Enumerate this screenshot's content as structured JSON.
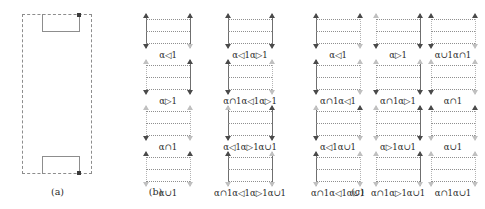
{
  "figure": {
    "width": 485,
    "height": 209,
    "background": "#ffffff",
    "ink": "#2a2a2a",
    "rail_solid_color": "#6f6f6f",
    "rail_dotted_color": "#b4b4b4",
    "hbar_color": "#8f8f8f",
    "marker_color": "#3a3a3a"
  },
  "panels": [
    {
      "id": "a",
      "caption": "(a)",
      "kind": "region-sketch",
      "description": "dashed rectangular region with solid notch at top and bottom",
      "markers": 2
    },
    {
      "id": "b",
      "caption": "(b)",
      "kind": "cell-grid",
      "columns": 1,
      "rows": 4,
      "cells": [
        {
          "label": "α◁1",
          "base": "α",
          "operators": [
            "◁"
          ],
          "index": "1",
          "left_rail": "solid",
          "right_rail": "solid",
          "left_arrow_top": true,
          "left_arrow_bottom": true,
          "right_arrow_top": true,
          "right_arrow_bottom": false
        },
        {
          "label": "α▷1",
          "base": "α",
          "operators": [
            "▷"
          ],
          "index": "1",
          "left_rail": "dotted",
          "right_rail": "solid",
          "left_arrow_top": false,
          "left_arrow_bottom": true,
          "right_arrow_top": true,
          "right_arrow_bottom": true
        },
        {
          "label": "α∩1",
          "base": "α",
          "operators": [
            "∩"
          ],
          "index": "1",
          "left_rail": "dotted",
          "right_rail": "dotted",
          "left_arrow_top": false,
          "left_arrow_bottom": true,
          "right_arrow_top": false,
          "right_arrow_bottom": false
        },
        {
          "label": "α∪1",
          "base": "α",
          "operators": [
            "∪"
          ],
          "index": "1",
          "left_rail": "dotted",
          "right_rail": "dotted",
          "left_arrow_top": true,
          "left_arrow_bottom": false,
          "right_arrow_top": true,
          "right_arrow_bottom": false
        }
      ]
    },
    {
      "id": "c",
      "caption": "(c)",
      "kind": "cell-grid",
      "columns": 4,
      "rows": 4,
      "cells": [
        {
          "label": "α◁1α▷1",
          "left_rail": "solid",
          "right_rail": "solid",
          "left_arrow_top": true,
          "left_arrow_bottom": true,
          "right_arrow_top": true,
          "right_arrow_bottom": true
        },
        {
          "label": "α◁1",
          "left_rail": "solid",
          "right_rail": "dotted",
          "left_arrow_top": true,
          "left_arrow_bottom": true,
          "right_arrow_top": true,
          "right_arrow_bottom": false
        },
        {
          "label": "α▷1",
          "left_rail": "dotted",
          "right_rail": "solid",
          "left_arrow_top": false,
          "left_arrow_bottom": true,
          "right_arrow_top": true,
          "right_arrow_bottom": true
        },
        {
          "label": "α∪1α∩1",
          "left_rail": "dotted",
          "right_rail": "dotted",
          "left_arrow_top": true,
          "left_arrow_bottom": true,
          "right_arrow_top": true,
          "right_arrow_bottom": false
        },
        {
          "label": "α∩1α◁1α▷1",
          "left_rail": "solid",
          "right_rail": "dotted",
          "left_arrow_top": true,
          "left_arrow_bottom": true,
          "right_arrow_top": false,
          "right_arrow_bottom": false
        },
        {
          "label": "α∩1α◁1",
          "left_rail": "solid",
          "right_rail": "dotted",
          "left_arrow_top": true,
          "left_arrow_bottom": true,
          "right_arrow_top": false,
          "right_arrow_bottom": false
        },
        {
          "label": "α∩1α▷1",
          "left_rail": "dotted",
          "right_rail": "solid",
          "left_arrow_top": false,
          "left_arrow_bottom": true,
          "right_arrow_top": false,
          "right_arrow_bottom": true
        },
        {
          "label": "α∩1",
          "left_rail": "dotted",
          "right_rail": "dotted",
          "left_arrow_top": false,
          "left_arrow_bottom": true,
          "right_arrow_top": false,
          "right_arrow_bottom": false
        },
        {
          "label": "α◁1α▷1α∪1",
          "left_rail": "solid",
          "right_rail": "solid",
          "left_arrow_top": false,
          "left_arrow_bottom": true,
          "right_arrow_top": true,
          "right_arrow_bottom": true
        },
        {
          "label": "α◁1α∪1",
          "left_rail": "solid",
          "right_rail": "dotted",
          "left_arrow_top": false,
          "left_arrow_bottom": true,
          "right_arrow_top": true,
          "right_arrow_bottom": false
        },
        {
          "label": "α▷1α∪1",
          "left_rail": "dotted",
          "right_rail": "solid",
          "left_arrow_top": false,
          "left_arrow_bottom": false,
          "right_arrow_top": true,
          "right_arrow_bottom": true
        },
        {
          "label": "α∪1",
          "left_rail": "dotted",
          "right_rail": "dotted",
          "left_arrow_top": true,
          "left_arrow_bottom": false,
          "right_arrow_top": true,
          "right_arrow_bottom": false
        },
        {
          "label": "α∩1α◁1α▷1α∪1",
          "left_rail": "solid",
          "right_rail": "solid",
          "left_arrow_top": true,
          "left_arrow_bottom": false,
          "right_arrow_top": false,
          "right_arrow_bottom": false
        },
        {
          "label": "α∩1α◁1α∪1",
          "left_rail": "solid",
          "right_rail": "dotted",
          "left_arrow_top": true,
          "left_arrow_bottom": false,
          "right_arrow_top": false,
          "right_arrow_bottom": false
        },
        {
          "label": "α∩1α▷1α∪1",
          "left_rail": "dotted",
          "right_rail": "solid",
          "left_arrow_top": false,
          "left_arrow_bottom": false,
          "right_arrow_top": true,
          "right_arrow_bottom": false
        },
        {
          "label": "α∩1α∪1",
          "left_rail": "dotted",
          "right_rail": "dotted",
          "left_arrow_top": false,
          "left_arrow_bottom": false,
          "right_arrow_top": false,
          "right_arrow_bottom": false
        }
      ]
    }
  ]
}
